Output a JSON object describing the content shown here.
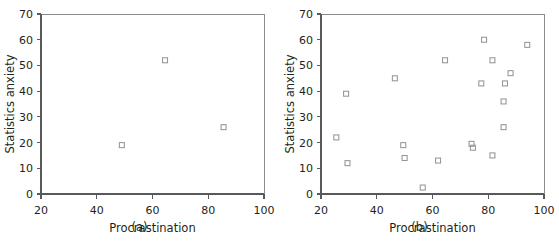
{
  "figure": {
    "name": "scatterplot-pair-procrastination-statistics-anxiety",
    "background": "#ffffff",
    "marker_color": "#939598",
    "axis_color": "#58595b",
    "text_color": "#231f20"
  },
  "chart_data": [
    {
      "type": "scatter",
      "panel_label": "(a)",
      "title": "",
      "xlabel": "Procrastination",
      "ylabel": "Statistics anxiety",
      "xlim": [
        20,
        100
      ],
      "ylim": [
        0,
        70
      ],
      "xticks": [
        20,
        40,
        60,
        80,
        100
      ],
      "yticks": [
        0,
        10,
        20,
        30,
        40,
        50,
        60,
        70
      ],
      "xtick_labels": [
        "20",
        "40",
        "60",
        "80",
        "100"
      ],
      "ytick_labels": [
        "0",
        "10",
        "20",
        "30",
        "40",
        "50",
        "60",
        "70"
      ],
      "grid": false,
      "legend": false,
      "marker": "open-square",
      "n_points": 3,
      "points": [
        {
          "x": 49,
          "y": 19
        },
        {
          "x": 64.5,
          "y": 52
        },
        {
          "x": 85.5,
          "y": 26
        }
      ],
      "x": [
        49,
        64.5,
        85.5
      ],
      "y": [
        19,
        52,
        26
      ]
    },
    {
      "type": "scatter",
      "panel_label": "(b)",
      "title": "",
      "xlabel": "Procrastination",
      "ylabel": "Statistics anxiety",
      "xlim": [
        20,
        100
      ],
      "ylim": [
        0,
        70
      ],
      "xticks": [
        20,
        40,
        60,
        80,
        100
      ],
      "yticks": [
        0,
        10,
        20,
        30,
        40,
        50,
        60,
        70
      ],
      "xtick_labels": [
        "20",
        "40",
        "60",
        "80",
        "100"
      ],
      "ytick_labels": [
        "0",
        "10",
        "20",
        "30",
        "40",
        "50",
        "60",
        "70"
      ],
      "grid": false,
      "legend": false,
      "marker": "open-square",
      "n_points": 21,
      "points": [
        {
          "x": 25.5,
          "y": 22
        },
        {
          "x": 29,
          "y": 39
        },
        {
          "x": 29.5,
          "y": 12
        },
        {
          "x": 46.5,
          "y": 45
        },
        {
          "x": 49.5,
          "y": 19
        },
        {
          "x": 50,
          "y": 14
        },
        {
          "x": 56.5,
          "y": 2.5
        },
        {
          "x": 62,
          "y": 13
        },
        {
          "x": 64.5,
          "y": 52
        },
        {
          "x": 74,
          "y": 19.5
        },
        {
          "x": 74.5,
          "y": 18
        },
        {
          "x": 77.5,
          "y": 43
        },
        {
          "x": 78.5,
          "y": 60
        },
        {
          "x": 81.5,
          "y": 52
        },
        {
          "x": 81.5,
          "y": 15
        },
        {
          "x": 85.5,
          "y": 36
        },
        {
          "x": 85.5,
          "y": 26
        },
        {
          "x": 86,
          "y": 43
        },
        {
          "x": 88,
          "y": 47
        },
        {
          "x": 94,
          "y": 58
        }
      ],
      "x": [
        25.5,
        29,
        29.5,
        46.5,
        49.5,
        50,
        56.5,
        62,
        64.5,
        74,
        74.5,
        77.5,
        78.5,
        81.5,
        81.5,
        85.5,
        85.5,
        86,
        88,
        94
      ],
      "y": [
        22,
        39,
        12,
        45,
        19,
        14,
        2.5,
        13,
        52,
        19.5,
        18,
        43,
        60,
        52,
        15,
        36,
        26,
        43,
        47,
        58
      ]
    }
  ]
}
